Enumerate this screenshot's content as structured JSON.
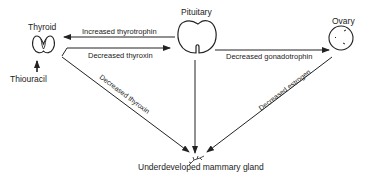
{
  "nodes": {
    "thyroid": {
      "label": "Thyroid"
    },
    "pituitary": {
      "label": "Pituitary"
    },
    "ovary": {
      "label": "Ovary"
    },
    "thiouracil": {
      "label": "Thiouracil"
    },
    "mammary": {
      "label": "Underdeveloped mammary gland"
    }
  },
  "edges": {
    "pit_to_thyroid": {
      "label": "Increased thyrotrophin"
    },
    "thyroid_to_pit": {
      "label": "Decreased thyroxin"
    },
    "thyroid_to_mammary": {
      "label": "Decreased thyroxin"
    },
    "pit_to_ovary": {
      "label": "Decreased gonadotrophin"
    },
    "ovary_to_mammary": {
      "label": "Decreased estrogen"
    }
  },
  "colors": {
    "line": "#222222",
    "background": "#ffffff"
  }
}
